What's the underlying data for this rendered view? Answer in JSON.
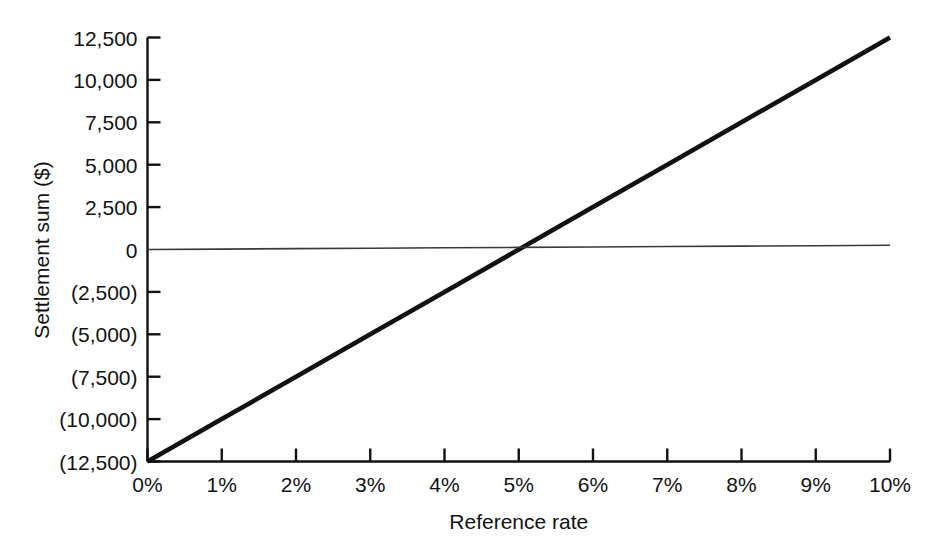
{
  "chart_data": {
    "type": "line",
    "title": "",
    "xlabel": "Reference rate",
    "ylabel": "Settlement sum ($)",
    "xlim": [
      0,
      10
    ],
    "ylim": [
      -12500,
      12500
    ],
    "grid": false,
    "legend": "none",
    "x_tick_labels": [
      "0%",
      "1%",
      "2%",
      "3%",
      "4%",
      "5%",
      "6%",
      "7%",
      "8%",
      "9%",
      "10%"
    ],
    "x_tick_values": [
      0,
      1,
      2,
      3,
      4,
      5,
      6,
      7,
      8,
      9,
      10
    ],
    "y_tick_labels": [
      "12,500",
      "10,000",
      "7,500",
      "5,000",
      "2,500",
      "0",
      "(2,500)",
      "(5,000)",
      "(7,500)",
      "(10,000)",
      "(12,500)"
    ],
    "y_tick_values": [
      12500,
      10000,
      7500,
      5000,
      2500,
      0,
      -2500,
      -5000,
      -7500,
      -10000,
      -12500
    ],
    "series": [
      {
        "name": "settlement-sum",
        "style": "thick",
        "color": "#111111",
        "x": [
          0,
          1,
          2,
          3,
          4,
          5,
          6,
          7,
          8,
          9,
          10
        ],
        "values": [
          -12500,
          -10000,
          -7500,
          -5000,
          -2500,
          0,
          2500,
          5000,
          7500,
          10000,
          12500
        ]
      },
      {
        "name": "zero-reference",
        "style": "thin",
        "color": "#3a3a3a",
        "x": [
          0,
          1,
          2,
          3,
          4,
          5,
          6,
          7,
          8,
          9,
          10
        ],
        "values": [
          0,
          25,
          50,
          75,
          100,
          125,
          150,
          175,
          200,
          225,
          250
        ]
      }
    ]
  },
  "axes": {
    "y_title": "Settlement sum ($)",
    "x_title": "Reference rate"
  }
}
